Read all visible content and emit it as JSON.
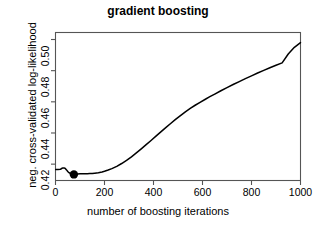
{
  "chart_data": {
    "type": "line",
    "title": "gradient boosting",
    "xlabel": "number of boosting iterations",
    "ylabel": "neg. cross-validated log-likelihood",
    "xlim": [
      0,
      1000
    ],
    "ylim": [
      0.4095,
      0.5045
    ],
    "grid": false,
    "legend": null,
    "xticks": [
      0,
      200,
      400,
      600,
      800,
      1000
    ],
    "xtick_labels": [
      "0",
      "200",
      "400",
      "600",
      "800",
      "1000"
    ],
    "yticks": [
      0.42,
      0.44,
      0.46,
      0.48,
      0.5
    ],
    "ytick_labels": [
      "0.42",
      "0.44",
      "0.46",
      "0.48",
      "0.50"
    ],
    "line_color": "#000000",
    "box_color": "#555555",
    "series": [
      {
        "name": "cv-error",
        "x": [
          1,
          10,
          20,
          25,
          30,
          35,
          40,
          45,
          50,
          55,
          60,
          65,
          70,
          75,
          80,
          85,
          90,
          100,
          110,
          120,
          130,
          140,
          150,
          160,
          175,
          190,
          200,
          215,
          230,
          250,
          270,
          290,
          310,
          330,
          350,
          370,
          390,
          410,
          430,
          450,
          470,
          490,
          510,
          530,
          550,
          570,
          590,
          610,
          630,
          650,
          675,
          700,
          725,
          750,
          775,
          800,
          825,
          850,
          875,
          900,
          925,
          950,
          975,
          1000
        ],
        "y": [
          0.4166,
          0.4166,
          0.4167,
          0.4172,
          0.4176,
          0.4176,
          0.4172,
          0.4163,
          0.4153,
          0.4145,
          0.414,
          0.4137,
          0.4135,
          0.4134,
          0.4135,
          0.4136,
          0.4137,
          0.4138,
          0.4139,
          0.4139,
          0.4139,
          0.414,
          0.414,
          0.4142,
          0.4145,
          0.415,
          0.4154,
          0.4162,
          0.4171,
          0.4186,
          0.4204,
          0.4224,
          0.4247,
          0.4272,
          0.4298,
          0.4325,
          0.4352,
          0.438,
          0.4407,
          0.4434,
          0.4461,
          0.4487,
          0.4512,
          0.4536,
          0.4558,
          0.4578,
          0.4597,
          0.4615,
          0.4633,
          0.465,
          0.4671,
          0.4691,
          0.4711,
          0.473,
          0.4749,
          0.4767,
          0.4785,
          0.4802,
          0.4819,
          0.4835,
          0.485,
          0.4907,
          0.495,
          0.498
        ]
      }
    ],
    "markers": [
      {
        "name": "optimal-iteration-marker",
        "x": 75,
        "y": 0.4134,
        "shape": "filled-circle",
        "color": "#000000"
      }
    ]
  }
}
